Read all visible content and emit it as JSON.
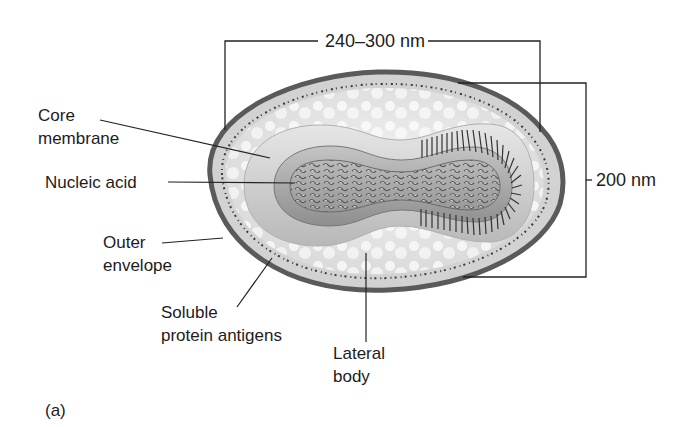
{
  "figure": {
    "panel_label": "(a)",
    "colors": {
      "envelope": "#6a6a6a",
      "background": "#ffffff",
      "line": "#222222"
    }
  },
  "dimensions": {
    "length": "240–300 nm",
    "width": "200 nm"
  },
  "labels": {
    "core_membrane": {
      "line1": "Core",
      "line2": "membrane"
    },
    "nucleic_acid": {
      "line1": "Nucleic acid"
    },
    "outer_envelope": {
      "line1": "Outer",
      "line2": "envelope"
    },
    "soluble_protein_antigens": {
      "line1": "Soluble",
      "line2": "protein antigens"
    },
    "lateral_body": {
      "line1": "Lateral",
      "line2": "body"
    }
  }
}
